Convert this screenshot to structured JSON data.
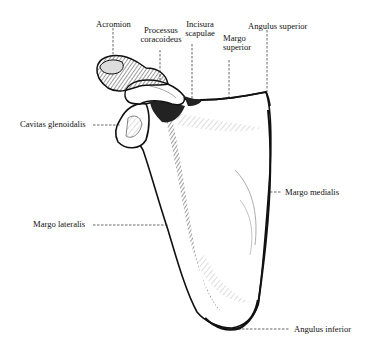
{
  "diagram": {
    "labels": [
      {
        "id": "acromion",
        "text": "Acromion"
      },
      {
        "id": "processus_coracoideus",
        "line1": "Processus",
        "line2": "coracoideus"
      },
      {
        "id": "incisura_scapulae",
        "line1": "Incisura",
        "line2": "scapulae"
      },
      {
        "id": "margo_superior",
        "line1": "Margo",
        "line2": "superior"
      },
      {
        "id": "angulus_superior",
        "text": "Angulus superior"
      },
      {
        "id": "cavitas_glenoidalis",
        "text": "Cavitas glenoidalis"
      },
      {
        "id": "margo_medialis",
        "text": "Margo medialis"
      },
      {
        "id": "margo_lateralis",
        "text": "Margo lateralis"
      },
      {
        "id": "angulus_inferior",
        "text": "Angulus inferior"
      }
    ],
    "colors": {
      "ink": "#111111",
      "paper": "#ffffff",
      "shade": "#333333"
    }
  }
}
